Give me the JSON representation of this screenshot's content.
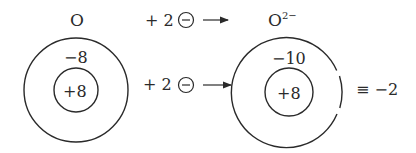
{
  "left_atom": {
    "label": "O",
    "shell_charge": "−8",
    "nucleus_charge": "+8"
  },
  "right_atom": {
    "label": "O",
    "superscript": "2−",
    "shell_charge": "−10",
    "nucleus_charge": "+8",
    "equivalence": "≡ −2"
  },
  "top_equation": {
    "plus": "+ 2",
    "electron_symbol": "−"
  },
  "middle_equation": {
    "plus": "+ 2",
    "electron_symbol": "−"
  }
}
